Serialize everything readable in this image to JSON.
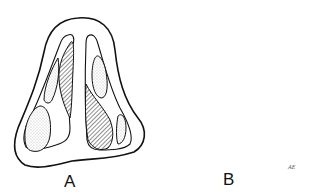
{
  "figure": {
    "type": "medical illustration",
    "panels": [
      {
        "id": "A",
        "label": "A"
      },
      {
        "id": "B",
        "label": "B"
      }
    ],
    "signature": "AE",
    "colors": {
      "line": "#111111",
      "background": "#ffffff",
      "stipple": "#8a8a8a"
    }
  }
}
